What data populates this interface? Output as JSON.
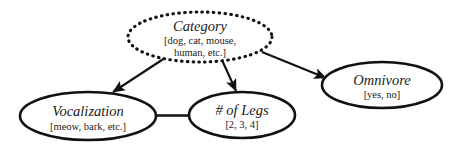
{
  "diagram": {
    "type": "bayesian-network-graph",
    "background_color": "#ffffff",
    "stroke_color": "#111111",
    "nodes": [
      {
        "id": "category",
        "title": "Category",
        "values": [
          "[dog, cat, mouse,",
          "human, etc.]"
        ],
        "values_text": "[dog, cat, mouse, human, etc.]",
        "border_style": "dotted",
        "shape": "ellipse",
        "cx": 200,
        "cy": 37,
        "rx": 72,
        "ry": 25
      },
      {
        "id": "vocalization",
        "title": "Vocalization",
        "values": [
          "[meow, bark, etc.]"
        ],
        "values_text": "[meow, bark, etc.]",
        "border_style": "solid",
        "shape": "ellipse",
        "cx": 88,
        "cy": 116,
        "rx": 68,
        "ry": 24
      },
      {
        "id": "legs",
        "title": "# of Legs",
        "values": [
          "[2, 3, 4]"
        ],
        "values_text": "[2, 3, 4]",
        "border_style": "solid",
        "shape": "ellipse",
        "cx": 242,
        "cy": 115,
        "rx": 53,
        "ry": 23
      },
      {
        "id": "omnivore",
        "title": "Omnivore",
        "values": [
          "[yes, no]"
        ],
        "values_text": "[yes, no]",
        "border_style": "solid",
        "shape": "ellipse",
        "cx": 382,
        "cy": 85,
        "rx": 60,
        "ry": 23
      }
    ],
    "edges": [
      {
        "id": "category-to-vocalization",
        "from": "Category",
        "to": "Vocalization",
        "directed": true
      },
      {
        "id": "category-to-legs",
        "from": "Category",
        "to": "# of Legs",
        "directed": true
      },
      {
        "id": "category-to-omnivore",
        "from": "Category",
        "to": "Omnivore",
        "directed": true
      },
      {
        "id": "vocalization-legs-link",
        "from": "Vocalization",
        "to": "# of Legs",
        "directed": false
      }
    ]
  }
}
